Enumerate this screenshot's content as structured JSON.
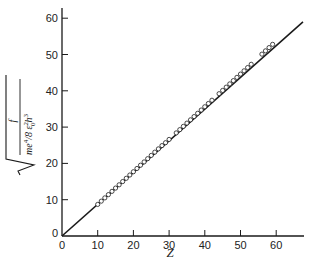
{
  "chart_data": {
    "type": "scatter",
    "title": "",
    "xlabel": "Z",
    "ylabel": "sqrt( f / (m e^4 / 8 ε0^2 h^3) )",
    "ylabel_parts": {
      "numerator": "f",
      "denominator_main": "me",
      "denominator_exp1": "4",
      "denominator_rest": "/8 ε",
      "eps_sub": "0",
      "eps_sup": "2",
      "h": "h",
      "h_sup": "3"
    },
    "xlim": [
      0,
      68
    ],
    "ylim": [
      0,
      62
    ],
    "x_ticks": [
      0,
      10,
      20,
      30,
      40,
      50,
      60
    ],
    "y_ticks": [
      0,
      10,
      20,
      30,
      40,
      50,
      60
    ],
    "grid": false,
    "legend": null,
    "fit_line": {
      "x": [
        0,
        67.5
      ],
      "y": [
        0,
        59
      ]
    },
    "series": [
      {
        "name": "measured",
        "marker": "open-circle",
        "points": [
          [
            10,
            8.7
          ],
          [
            11,
            9.6
          ],
          [
            12,
            10.5
          ],
          [
            13,
            11.4
          ],
          [
            14,
            12.3
          ],
          [
            15,
            13.2
          ],
          [
            16,
            14.1
          ],
          [
            17,
            15.0
          ],
          [
            18,
            15.9
          ],
          [
            19,
            16.8
          ],
          [
            20,
            17.7
          ],
          [
            21,
            18.6
          ],
          [
            22,
            19.5
          ],
          [
            23,
            20.4
          ],
          [
            24,
            21.3
          ],
          [
            25,
            22.2
          ],
          [
            26,
            23.1
          ],
          [
            27,
            24.0
          ],
          [
            28,
            24.9
          ],
          [
            29,
            25.7
          ],
          [
            30,
            26.6
          ],
          [
            32,
            28.4
          ],
          [
            33,
            29.3
          ],
          [
            34,
            30.2
          ],
          [
            35,
            31.1
          ],
          [
            36,
            32.0
          ],
          [
            37,
            32.9
          ],
          [
            38,
            33.8
          ],
          [
            39,
            34.7
          ],
          [
            40,
            35.6
          ],
          [
            41,
            36.5
          ],
          [
            42,
            37.4
          ],
          [
            44,
            39.2
          ],
          [
            45,
            40.1
          ],
          [
            46,
            41.0
          ],
          [
            47,
            41.9
          ],
          [
            48,
            42.8
          ],
          [
            49,
            43.7
          ],
          [
            50,
            44.6
          ],
          [
            51,
            45.5
          ],
          [
            52,
            46.4
          ],
          [
            53,
            47.3
          ],
          [
            56,
            50.1
          ],
          [
            57,
            51.0
          ],
          [
            58,
            51.9
          ],
          [
            59,
            52.8
          ]
        ]
      }
    ]
  },
  "axes": {
    "x_tick_labels": [
      "0",
      "10",
      "20",
      "30",
      "40",
      "50",
      "60"
    ],
    "y_tick_labels": [
      "0",
      "10",
      "20",
      "30",
      "40",
      "50",
      "60"
    ],
    "x_title": "Z"
  },
  "colors": {
    "ink": "#1a1a1a",
    "background": "#ffffff"
  }
}
